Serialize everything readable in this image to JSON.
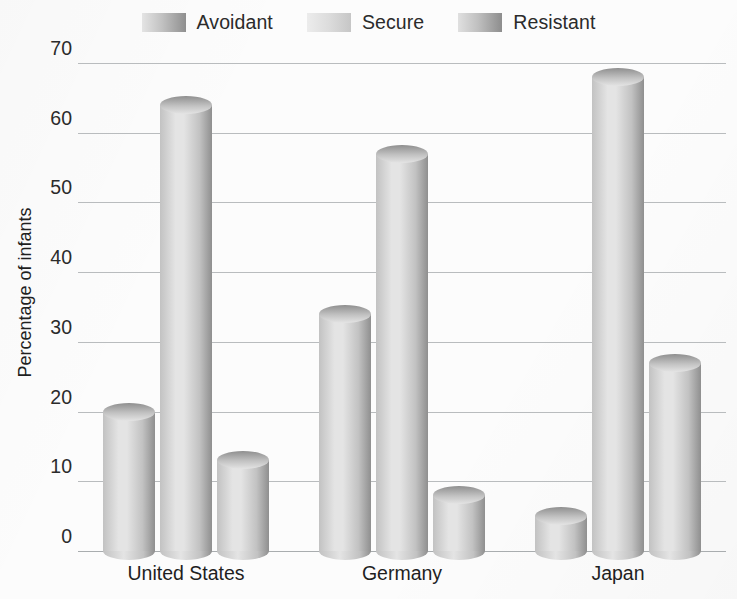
{
  "chart_data": {
    "type": "bar",
    "title": "",
    "subtitle": "",
    "xlabel": "",
    "ylabel": "Percentage of infants",
    "categories": [
      "United States",
      "Germany",
      "Japan"
    ],
    "series": [
      {
        "name": "Avoidant",
        "values": [
          20,
          34,
          5
        ],
        "color": "#a8a8a8"
      },
      {
        "name": "Secure",
        "values": [
          64,
          57,
          68
        ],
        "color": "#c9c9c9"
      },
      {
        "name": "Resistant",
        "values": [
          13,
          8,
          27
        ],
        "color": "#9f9f9f"
      }
    ],
    "ylim": [
      0,
      70
    ],
    "yticks": [
      0,
      10,
      20,
      30,
      40,
      50,
      60,
      70
    ],
    "ytick_labels": [
      "0",
      "10",
      "20",
      "30",
      "40",
      "50",
      "60",
      "70"
    ],
    "grid": true,
    "legend_position": "top",
    "bar_style": "3d-cylinder"
  },
  "legend": {
    "items": [
      {
        "label": "Avoidant",
        "swatch_name": "legend-swatch-avoidant"
      },
      {
        "label": "Secure",
        "swatch_name": "legend-swatch-secure"
      },
      {
        "label": "Resistant",
        "swatch_name": "legend-swatch-resistant"
      }
    ]
  },
  "colors": {
    "background": "#fcfcfc",
    "gridline": "#b9bcbe",
    "axis": "#a9adaf",
    "text": "#1f1f1f",
    "cylinder_light": "#e4e4e4",
    "cylinder_mid": "#c2c2c2",
    "cylinder_dark": "#8f8f8f"
  }
}
